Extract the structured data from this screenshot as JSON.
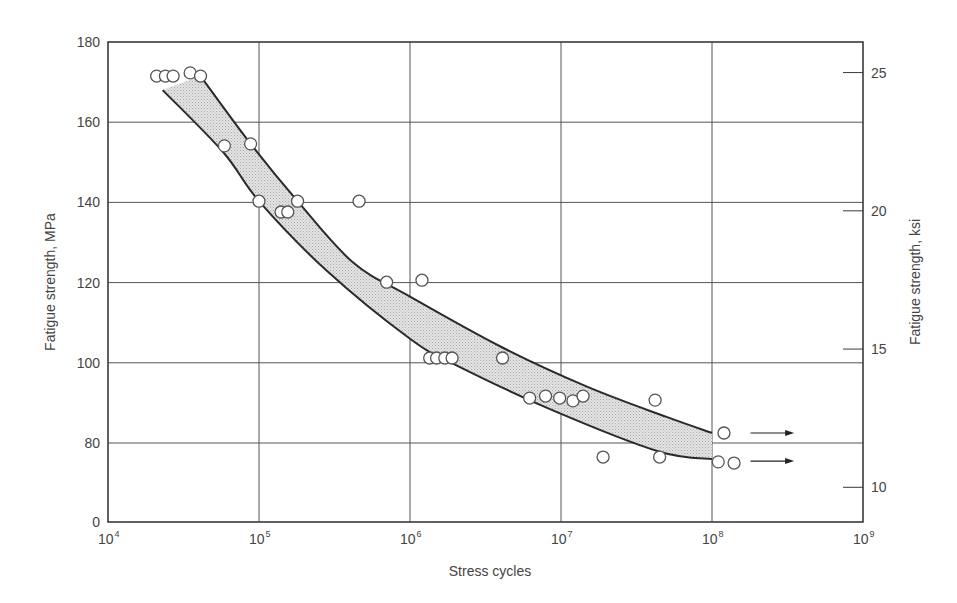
{
  "chart_data": {
    "type": "scatter",
    "title": "",
    "xlabel": "Stress cycles",
    "ylabel": "Fatigue strength, MPa",
    "ylabel_right": "Fatigue strength, ksi",
    "xscale": "log",
    "xlim": [
      10000,
      1000000000
    ],
    "ylim": [
      0,
      180
    ],
    "y_axis_break": "between 0 and 80 (80 immediately above 0)",
    "grid": true,
    "legend": null,
    "x_ticks": [
      {
        "base": "10",
        "exp": "4",
        "value": 10000
      },
      {
        "base": "10",
        "exp": "5",
        "value": 100000
      },
      {
        "base": "10",
        "exp": "6",
        "value": 1000000
      },
      {
        "base": "10",
        "exp": "7",
        "value": 10000000
      },
      {
        "base": "10",
        "exp": "8",
        "value": 100000000
      },
      {
        "base": "10",
        "exp": "9",
        "value": 1000000000
      }
    ],
    "y_ticks": [
      "0",
      "80",
      "100",
      "120",
      "140",
      "160",
      "180"
    ],
    "y_ticks_right": [
      "10",
      "15",
      "20",
      "25"
    ],
    "series": [
      {
        "name": "Test data",
        "marker": "open-circle",
        "points": [
          {
            "x": 21000,
            "y": 171.5
          },
          {
            "x": 24000,
            "y": 171.5
          },
          {
            "x": 27000,
            "y": 171.5
          },
          {
            "x": 35000,
            "y": 172.3
          },
          {
            "x": 41000,
            "y": 171.5
          },
          {
            "x": 59000,
            "y": 154.1
          },
          {
            "x": 88000,
            "y": 154.6
          },
          {
            "x": 100000,
            "y": 140.3
          },
          {
            "x": 140000,
            "y": 137.6
          },
          {
            "x": 155000,
            "y": 137.6
          },
          {
            "x": 180000,
            "y": 140.3
          },
          {
            "x": 460000,
            "y": 140.3
          },
          {
            "x": 700000,
            "y": 120.1
          },
          {
            "x": 1200000,
            "y": 120.6
          },
          {
            "x": 1350000,
            "y": 101.2
          },
          {
            "x": 1500000,
            "y": 101.2
          },
          {
            "x": 1700000,
            "y": 101.2
          },
          {
            "x": 1900000,
            "y": 101.2
          },
          {
            "x": 4100000,
            "y": 101.2
          },
          {
            "x": 6200000,
            "y": 91.2
          },
          {
            "x": 7900000,
            "y": 91.7
          },
          {
            "x": 9800000,
            "y": 91.2
          },
          {
            "x": 12000000,
            "y": 90.5
          },
          {
            "x": 14000000,
            "y": 91.7
          },
          {
            "x": 19000000,
            "y": 76.5
          },
          {
            "x": 42000000,
            "y": 90.7
          },
          {
            "x": 45000000,
            "y": 76.5
          },
          {
            "x": 110000000,
            "y": 75.3
          },
          {
            "x": 120000000,
            "y": 82.5,
            "runout": true
          },
          {
            "x": 140000000,
            "y": 75.0,
            "runout": true
          }
        ]
      }
    ],
    "scatter_band": {
      "name": "Scatter band (shaded)",
      "upper": [
        {
          "x": 41000,
          "y": 171.5
        },
        {
          "x": 88000,
          "y": 154.6
        },
        {
          "x": 180000,
          "y": 140.3
        },
        {
          "x": 420000,
          "y": 125
        },
        {
          "x": 1000000,
          "y": 116.5
        },
        {
          "x": 4000000,
          "y": 104
        },
        {
          "x": 15000000,
          "y": 94
        },
        {
          "x": 50000000,
          "y": 86.5
        },
        {
          "x": 100000000,
          "y": 82.5
        }
      ],
      "lower": [
        {
          "x": 23000,
          "y": 168
        },
        {
          "x": 58000,
          "y": 152.5
        },
        {
          "x": 100000,
          "y": 140.3
        },
        {
          "x": 280000,
          "y": 123
        },
        {
          "x": 1000000,
          "y": 106
        },
        {
          "x": 2000000,
          "y": 99.5
        },
        {
          "x": 9000000,
          "y": 88
        },
        {
          "x": 45000000,
          "y": 77.8
        },
        {
          "x": 100000000,
          "y": 76
        }
      ]
    },
    "annotations": [
      {
        "type": "runout-arrow",
        "y": 82.5,
        "from_x": 180000000,
        "to_x": 350000000
      },
      {
        "type": "runout-arrow",
        "y": 75.5,
        "from_x": 180000000,
        "to_x": 350000000
      }
    ]
  },
  "colors": {
    "axis": "#3a3a3a",
    "grid": "#555555",
    "band_fill": "#d4d4d4",
    "band_edge": "#2a2a2a",
    "marker_edge": "#555555",
    "marker_fill": "#ffffff",
    "text": "#444444"
  }
}
